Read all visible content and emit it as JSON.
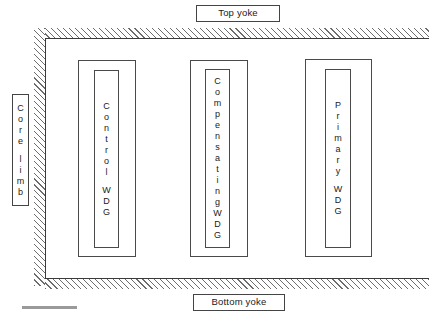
{
  "diagram": {
    "type": "cross-section-schematic",
    "top_yoke": {
      "label": "Top yoke"
    },
    "bottom_yoke": {
      "label": "Bottom yoke"
    },
    "core_limb": {
      "label": "Core limb",
      "characters": [
        "C",
        "o",
        "r",
        "e",
        " ",
        "l",
        "i",
        "m",
        "b"
      ]
    },
    "windings": [
      {
        "name": "control-winding",
        "label": "Control WDG",
        "characters": [
          "C",
          "o",
          "n",
          "t",
          "r",
          "o",
          "l",
          " ",
          "W",
          "D",
          "G"
        ]
      },
      {
        "name": "compensating-winding",
        "label": "Compensating WDG",
        "characters": [
          "C",
          "o",
          "m",
          "p",
          "e",
          "n",
          "s",
          "a",
          "t",
          "i",
          "n",
          "g",
          "W",
          "D",
          "G"
        ]
      },
      {
        "name": "primary-winding",
        "label": "Primary WDG",
        "characters": [
          "P",
          "r",
          "i",
          "m",
          "a",
          "r",
          "y",
          " ",
          "W",
          "D",
          "G"
        ]
      }
    ],
    "colors": {
      "line": "#4a4a4a",
      "hatch": "#6d6d6d",
      "background": "#ffffff",
      "text": "#1a1a1a",
      "scale_rule": "#9a9a9a"
    }
  }
}
